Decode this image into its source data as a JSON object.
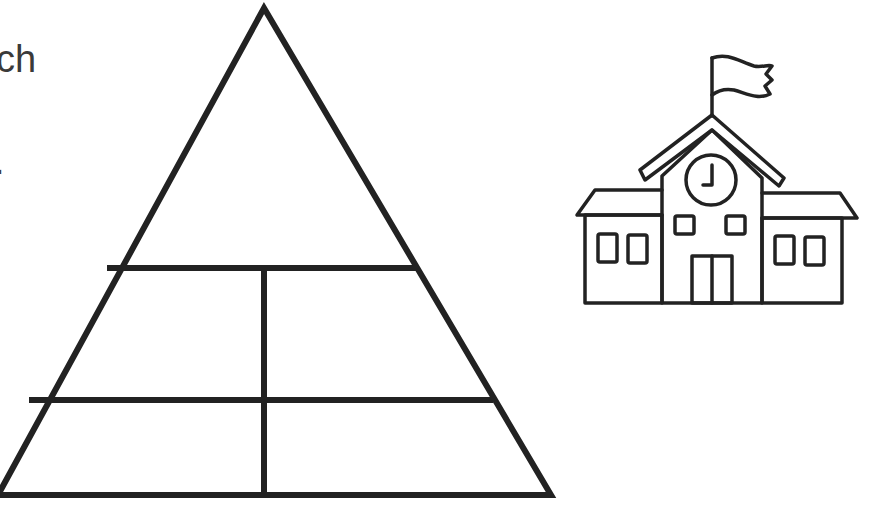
{
  "worksheet": {
    "text_fragments": [
      {
        "id": "line1",
        "text": "ch"
      },
      {
        "id": "line2",
        "text": "."
      }
    ],
    "pyramid": {
      "label": "pyramid-diagram",
      "rows": 3,
      "sections": [
        "top",
        "middle-left",
        "middle-right",
        "bottom-left",
        "bottom-right"
      ],
      "stroke_color": "#222222"
    },
    "illustration": {
      "label": "school-building",
      "elements": [
        "flag",
        "roof",
        "clock",
        "windows",
        "door"
      ],
      "clock_time": "3:00"
    }
  }
}
